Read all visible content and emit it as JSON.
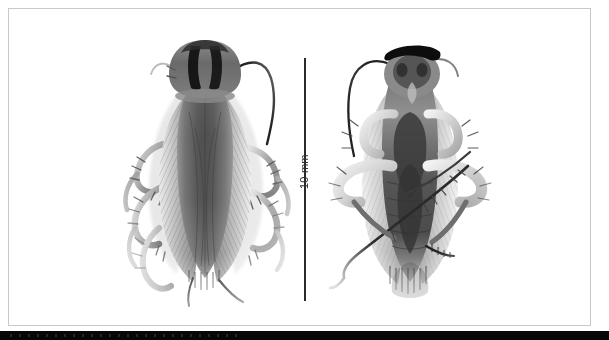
{
  "figure": {
    "type": "scientific-specimen-photograph",
    "background_color": "#ffffff",
    "frame_color": "#c9c9cd",
    "ink_color": "#2a2a2a",
    "panel_count": 2
  },
  "scalebar": {
    "label": "10 mm",
    "orientation": "vertical",
    "length_px": 243,
    "color": "#2a2a2a"
  },
  "panels": [
    {
      "id": "specimen-dorsal",
      "view": "dorsal",
      "position": "left",
      "description": "cockroach dorsal habitus with tegmina and pronotal stripes"
    },
    {
      "id": "specimen-ventral",
      "view": "ventral",
      "position": "right",
      "description": "cockroach ventral habitus with legs, coxae and sternites"
    }
  ],
  "bottom_strip": {
    "color": "#070707",
    "height_px": 9
  }
}
